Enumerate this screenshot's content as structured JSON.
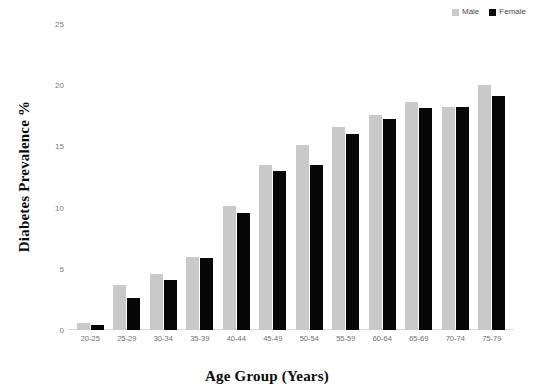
{
  "chart_data": {
    "type": "bar",
    "title": "",
    "xlabel": "Age Group (Years)",
    "ylabel": "Diabetes Prevalence %",
    "categories": [
      "20-25",
      "25-29",
      "30-34",
      "35-39",
      "40-44",
      "45-49",
      "50-54",
      "55-59",
      "60-64",
      "65-69",
      "70-74",
      "75-79"
    ],
    "series": [
      {
        "name": "Male",
        "color": "#c9c9c9",
        "values": [
          0.6,
          3.7,
          4.6,
          6.0,
          10.1,
          13.5,
          15.1,
          16.6,
          17.6,
          18.6,
          18.2,
          20.0
        ]
      },
      {
        "name": "Female",
        "color": "#070707",
        "values": [
          0.4,
          2.6,
          4.1,
          5.9,
          9.6,
          13.0,
          13.5,
          16.0,
          17.2,
          18.1,
          18.2,
          19.1
        ]
      }
    ],
    "yticks": [
      0,
      5,
      10,
      15,
      20,
      25
    ],
    "ylim": [
      0,
      25
    ],
    "grid": false,
    "legend_position": "top-right"
  },
  "legend": {
    "entries": [
      {
        "label": "Male",
        "color": "#c9c9c9"
      },
      {
        "label": "Female",
        "color": "#070707"
      }
    ]
  },
  "axes": {
    "y_title": "Diabetes Prevalence %",
    "x_title": "Age Group (Years)",
    "y_tick_labels": [
      "25",
      "20",
      "15",
      "10",
      "5",
      "0"
    ],
    "x_tick_labels": [
      "20-25",
      "25-29",
      "30-34",
      "35-39",
      "40-44",
      "45-49",
      "50-54",
      "55-59",
      "60-64",
      "65-69",
      "70-74",
      "75-79"
    ]
  }
}
